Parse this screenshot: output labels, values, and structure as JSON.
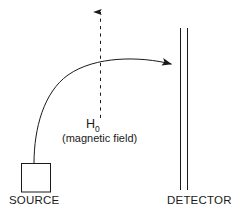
{
  "figure": {
    "type": "physics-schematic",
    "background_color": "#ffffff",
    "stroke_color": "#1a1a1a"
  },
  "labels": {
    "source": "SOURCE",
    "detector": "DETECTOR",
    "field_symbol_base": "H",
    "field_symbol_subscript": "0",
    "field_caption": "(magnetic field)"
  },
  "elements": {
    "source_box": {
      "name": "source-box",
      "shape": "square",
      "x": 21,
      "y": 163,
      "width": 30,
      "height": 29
    },
    "detector_plate": {
      "name": "detector-plate",
      "shape": "double-vertical-line",
      "line1_x": 180,
      "line2_x": 187,
      "y_top": 28,
      "y_bottom": 190
    },
    "beam_path": {
      "name": "beam-trajectory",
      "style": "solid-curve-with-arrowhead",
      "start": [
        34,
        163
      ],
      "end": [
        174,
        63
      ],
      "arrow_direction": "right-down"
    },
    "field_arrow": {
      "name": "magnetic-field-arrow",
      "style": "dashed-vertical-arrow",
      "x": 100,
      "y_top": 8,
      "y_bottom": 118,
      "arrow_direction": "up"
    }
  }
}
